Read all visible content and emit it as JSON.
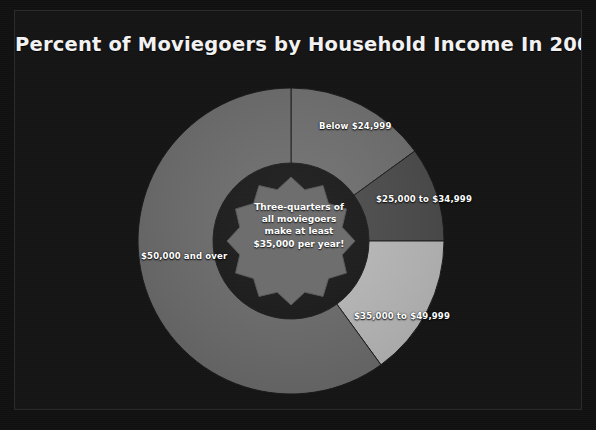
{
  "chart_data": {
    "type": "pie",
    "title": "Percent of Moviegoers by Household Income In 2007",
    "xlabel": "",
    "ylabel": "",
    "legend_position": "none",
    "grid": false,
    "donut": true,
    "start_angle_deg": 0,
    "categories": [
      "Below $24,999",
      "$25,000 to $34,999",
      "$35,000 to $49,999",
      "$50,000 and over"
    ],
    "values": [
      15,
      10,
      15,
      60
    ],
    "colors": [
      "#6e6e6e",
      "#4a4a4a",
      "#b9b9b9",
      "#6b6b6b"
    ],
    "annotations": [
      "Three-quarters of",
      "all moviegoers",
      "make at least",
      "$35,000 per year!"
    ],
    "slices": [
      {
        "label": "Below $24,999",
        "value": 15,
        "color": "#6e6e6e"
      },
      {
        "label": "$25,000 to $34,999",
        "value": 10,
        "color": "#4a4a4a"
      },
      {
        "label": "$35,000 to $49,999",
        "value": 15,
        "color": "#b9b9b9"
      },
      {
        "label": "$50,000 and over",
        "value": 60,
        "color": "#6b6b6b"
      }
    ]
  },
  "center_badge": {
    "line1": "Three-quarters of",
    "line2": "all moviegoers",
    "line3": "make at least",
    "line4": "$35,000 per year!",
    "fill_color": "#6e6e6e"
  },
  "theme": {
    "background": "#151515",
    "title_color": "#f2f2f2",
    "label_color": "#ffffff"
  }
}
